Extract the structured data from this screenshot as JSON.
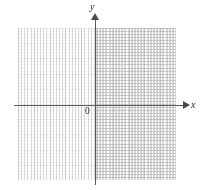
{
  "figure": {
    "type": "coordinate-plane",
    "title": "",
    "width": 201,
    "height": 190,
    "background_color": "#ffffff"
  },
  "axes": {
    "x_axis": {
      "label": "x",
      "label_name": "x-axis-label",
      "arrow": "right",
      "color": "#5a5a5a",
      "pixel_y": 105,
      "start_px": 14,
      "end_px": 190
    },
    "y_axis": {
      "label": "y",
      "label_name": "y-axis-label",
      "arrow": "up",
      "color": "#5a5a5a",
      "pixel_x": 95,
      "start_px": 13,
      "end_px": 185
    },
    "origin": {
      "label": "0",
      "color": "#2b2b2b"
    }
  },
  "grid": {
    "minor_color": "#d8d8d8",
    "major_color": "#c9c9c9",
    "minor_spacing_px": 3.1,
    "major_spacing_px": 15.5,
    "left_px": 18,
    "top_px": 28,
    "width_px": 158,
    "height_px": 152,
    "style": "dotted"
  },
  "chart_data": {
    "type": "scatter",
    "title": "",
    "xlabel": "x",
    "ylabel": "y",
    "series": [
      {
        "name": "",
        "x": [],
        "y": []
      }
    ],
    "xlim": [
      -10,
      10
    ],
    "ylim": [
      -10,
      10
    ],
    "xticks": [],
    "yticks": [],
    "grid": true,
    "legend": "none",
    "annotations": [
      {
        "text": "0",
        "x": 0,
        "y": 0,
        "role": "origin-label"
      },
      {
        "text": "x",
        "role": "x-axis-label"
      },
      {
        "text": "y",
        "role": "y-axis-label"
      }
    ]
  }
}
